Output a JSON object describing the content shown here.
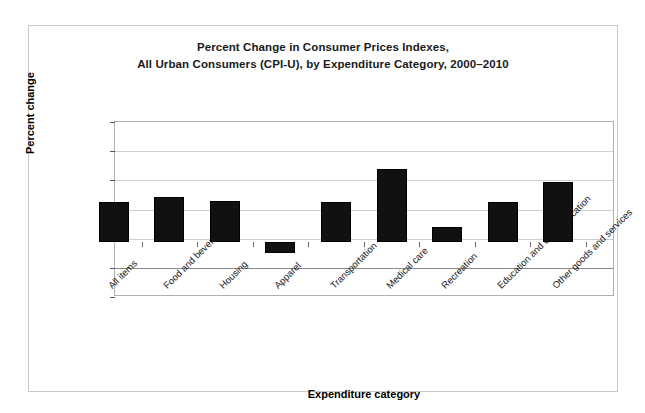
{
  "chart_data": {
    "type": "bar",
    "title": "Percent Change in Consumer Prices Indexes, All Urban Consumers (CPI-U), by Expenditure Category, 2000–2010",
    "title_lines": [
      "Percent Change in Consumer Prices Indexes,",
      "All Urban Consumers (CPI-U), by Expenditure Category, 2000–2010"
    ],
    "xlabel": "Expenditure category",
    "ylabel": "Percent change",
    "categories": [
      "All items",
      "Food and beverages",
      "Housing",
      "Apparel",
      "Transportation",
      "Medical care",
      "Recreation",
      "Education and communication",
      "Other goods and services"
    ],
    "values": [
      27,
      31,
      28,
      -8,
      27,
      50,
      10,
      27,
      41
    ],
    "ylim": [
      -20,
      100
    ],
    "yticks": [
      100,
      80,
      60,
      40,
      20,
      0,
      -20
    ],
    "ytick_labels": [
      "100",
      "80",
      "60",
      "40",
      "20",
      "0",
      "-20"
    ],
    "grid": true,
    "legend": false,
    "bar_color": "#111111",
    "grid_color": "#d0d0d0",
    "frame_color": "#c8c8c8"
  }
}
